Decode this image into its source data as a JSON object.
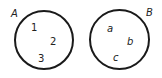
{
  "diagram": {
    "type": "two disjoint sets",
    "sets": [
      {
        "label": "A",
        "elements": [
          "1",
          "2",
          "3"
        ]
      },
      {
        "label": "B",
        "elements": [
          "a",
          "b",
          "c"
        ]
      }
    ],
    "colors": {
      "stroke": "#1a1a1a",
      "text": "#222222",
      "background": "#ffffff"
    }
  }
}
